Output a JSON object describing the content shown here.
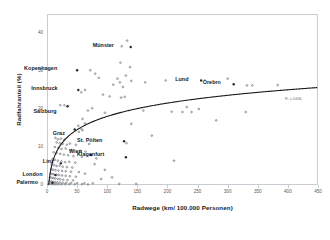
{
  "chart_data": {
    "type": "scatter",
    "title": "",
    "xlabel": "Radwege (km/ 100.000 Personen)",
    "ylabel": "Radfahranteil (%)",
    "xlim": [
      0,
      450
    ],
    "ylim": [
      0,
      45
    ],
    "grid": false,
    "legend": null,
    "xticks": [
      "0",
      "50",
      "100",
      "150",
      "200",
      "250",
      "300",
      "350",
      "400",
      "450"
    ],
    "xtick_values": [
      0,
      50,
      100,
      150,
      200,
      250,
      300,
      350,
      400,
      450
    ],
    "yticks": [
      "0",
      "10",
      "20",
      "30",
      "40"
    ],
    "ytick_values": [
      0,
      10,
      20,
      30,
      40
    ],
    "marker_color": "#6b7075",
    "trendline_color": "#1a1a1a",
    "trendline_type": "logarithmic",
    "annotation": "R² = 0,636",
    "points": [
      {
        "x": 133,
        "y": 38.0
      },
      {
        "x": 124,
        "y": 36.5
      },
      {
        "x": 122,
        "y": 32.2
      },
      {
        "x": 138,
        "y": 31.0
      },
      {
        "x": 72,
        "y": 30.2
      },
      {
        "x": 80,
        "y": 29.3
      },
      {
        "x": 86,
        "y": 28.2
      },
      {
        "x": 117,
        "y": 28.0
      },
      {
        "x": 131,
        "y": 28.8
      },
      {
        "x": 121,
        "y": 27.0
      },
      {
        "x": 140,
        "y": 27.4
      },
      {
        "x": 163,
        "y": 27.0
      },
      {
        "x": 197,
        "y": 27.5
      },
      {
        "x": 110,
        "y": 26.4
      },
      {
        "x": 126,
        "y": 25.8
      },
      {
        "x": 300,
        "y": 28.0
      },
      {
        "x": 332,
        "y": 26.2
      },
      {
        "x": 341,
        "y": 26.2
      },
      {
        "x": 383,
        "y": 26.3
      },
      {
        "x": 63,
        "y": 25.0
      },
      {
        "x": 57,
        "y": 24.4
      },
      {
        "x": 93,
        "y": 23.8
      },
      {
        "x": 104,
        "y": 23.3
      },
      {
        "x": 123,
        "y": 23.0
      },
      {
        "x": 129,
        "y": 23.2
      },
      {
        "x": 22,
        "y": 21.0
      },
      {
        "x": 29,
        "y": 21.0
      },
      {
        "x": 35,
        "y": 20.8
      },
      {
        "x": 75,
        "y": 20.2
      },
      {
        "x": 68,
        "y": 19.6
      },
      {
        "x": 96,
        "y": 19.0
      },
      {
        "x": 160,
        "y": 19.6
      },
      {
        "x": 232,
        "y": 20.5
      },
      {
        "x": 252,
        "y": 20.0
      },
      {
        "x": 207,
        "y": 19.3
      },
      {
        "x": 225,
        "y": 19.2
      },
      {
        "x": 240,
        "y": 19.2
      },
      {
        "x": 330,
        "y": 19.2
      },
      {
        "x": 281,
        "y": 17.0
      },
      {
        "x": 59,
        "y": 17.4
      },
      {
        "x": 63,
        "y": 16.2
      },
      {
        "x": 140,
        "y": 16.1
      },
      {
        "x": 52,
        "y": 15.6
      },
      {
        "x": 57,
        "y": 14.8
      },
      {
        "x": 59,
        "y": 14.4
      },
      {
        "x": 53,
        "y": 14.0
      },
      {
        "x": 174,
        "y": 13.0
      },
      {
        "x": 14,
        "y": 12.4
      },
      {
        "x": 18,
        "y": 12.0
      },
      {
        "x": 23,
        "y": 12.2
      },
      {
        "x": 29,
        "y": 11.9
      },
      {
        "x": 16,
        "y": 11.2
      },
      {
        "x": 21,
        "y": 11.0
      },
      {
        "x": 26,
        "y": 10.8
      },
      {
        "x": 33,
        "y": 10.6
      },
      {
        "x": 38,
        "y": 10.9
      },
      {
        "x": 48,
        "y": 10.6
      },
      {
        "x": 70,
        "y": 10.8
      },
      {
        "x": 132,
        "y": 11.0
      },
      {
        "x": 13,
        "y": 10.0
      },
      {
        "x": 19,
        "y": 9.8
      },
      {
        "x": 24,
        "y": 9.5
      },
      {
        "x": 31,
        "y": 9.6
      },
      {
        "x": 40,
        "y": 9.2
      },
      {
        "x": 55,
        "y": 9.0
      },
      {
        "x": 64,
        "y": 8.8
      },
      {
        "x": 11,
        "y": 8.6
      },
      {
        "x": 16,
        "y": 8.4
      },
      {
        "x": 22,
        "y": 8.2
      },
      {
        "x": 28,
        "y": 8.0
      },
      {
        "x": 35,
        "y": 7.8
      },
      {
        "x": 44,
        "y": 7.6
      },
      {
        "x": 58,
        "y": 7.4
      },
      {
        "x": 82,
        "y": 7.0
      },
      {
        "x": 211,
        "y": 6.4
      },
      {
        "x": 9,
        "y": 6.8
      },
      {
        "x": 13,
        "y": 6.6
      },
      {
        "x": 18,
        "y": 6.4
      },
      {
        "x": 24,
        "y": 6.2
      },
      {
        "x": 30,
        "y": 6.0
      },
      {
        "x": 37,
        "y": 6.1
      },
      {
        "x": 47,
        "y": 5.9
      },
      {
        "x": 8,
        "y": 5.4
      },
      {
        "x": 12,
        "y": 5.2
      },
      {
        "x": 16,
        "y": 5.0
      },
      {
        "x": 21,
        "y": 5.1
      },
      {
        "x": 26,
        "y": 4.8
      },
      {
        "x": 33,
        "y": 4.7
      },
      {
        "x": 42,
        "y": 4.6
      },
      {
        "x": 7,
        "y": 4.2
      },
      {
        "x": 10,
        "y": 4.0
      },
      {
        "x": 14,
        "y": 3.9
      },
      {
        "x": 19,
        "y": 3.8
      },
      {
        "x": 25,
        "y": 3.7
      },
      {
        "x": 31,
        "y": 3.6
      },
      {
        "x": 40,
        "y": 3.5
      },
      {
        "x": 53,
        "y": 3.4
      },
      {
        "x": 6,
        "y": 3.0
      },
      {
        "x": 9,
        "y": 2.9
      },
      {
        "x": 12,
        "y": 2.8
      },
      {
        "x": 16,
        "y": 2.7
      },
      {
        "x": 20,
        "y": 2.6
      },
      {
        "x": 25,
        "y": 2.5
      },
      {
        "x": 31,
        "y": 2.4
      },
      {
        "x": 38,
        "y": 2.3
      },
      {
        "x": 48,
        "y": 2.2
      },
      {
        "x": 5,
        "y": 2.0
      },
      {
        "x": 8,
        "y": 1.9
      },
      {
        "x": 11,
        "y": 1.8
      },
      {
        "x": 14,
        "y": 1.7
      },
      {
        "x": 18,
        "y": 1.6
      },
      {
        "x": 22,
        "y": 1.5
      },
      {
        "x": 27,
        "y": 1.4
      },
      {
        "x": 34,
        "y": 1.3
      },
      {
        "x": 43,
        "y": 1.2
      },
      {
        "x": 4,
        "y": 1.0
      },
      {
        "x": 7,
        "y": 0.9
      },
      {
        "x": 10,
        "y": 0.8
      },
      {
        "x": 13,
        "y": 0.75
      },
      {
        "x": 17,
        "y": 0.7
      },
      {
        "x": 21,
        "y": 0.65
      },
      {
        "x": 26,
        "y": 0.6
      },
      {
        "x": 32,
        "y": 0.55
      },
      {
        "x": 40,
        "y": 0.5
      },
      {
        "x": 50,
        "y": 0.5
      },
      {
        "x": 62,
        "y": 0.45
      },
      {
        "x": 76,
        "y": 0.45
      },
      {
        "x": 3,
        "y": 0.3
      },
      {
        "x": 6,
        "y": 0.28
      },
      {
        "x": 9,
        "y": 0.26
      },
      {
        "x": 12,
        "y": 0.24
      },
      {
        "x": 15,
        "y": 0.22
      },
      {
        "x": 19,
        "y": 0.2
      },
      {
        "x": 24,
        "y": 0.2
      },
      {
        "x": 30,
        "y": 0.2
      },
      {
        "x": 37,
        "y": 0.2
      },
      {
        "x": 46,
        "y": 0.2
      },
      {
        "x": 58,
        "y": 0.2
      },
      {
        "x": 68,
        "y": 0.15
      },
      {
        "x": 90,
        "y": 1.6
      },
      {
        "x": 96,
        "y": 4.0
      },
      {
        "x": 63,
        "y": 3.0
      },
      {
        "x": 79,
        "y": 5.5
      },
      {
        "x": 108,
        "y": 2.0
      },
      {
        "x": 120,
        "y": 0.3
      },
      {
        "x": 148,
        "y": 0.3
      }
    ],
    "labeled_points": [
      {
        "name": "Münster",
        "x": 139,
        "y": 36.3,
        "label_dx": -38,
        "label_dy": -2
      },
      {
        "name": "Kopenhagen",
        "x": 50,
        "y": 30.2,
        "label_dx": -53,
        "label_dy": -2
      },
      {
        "name": "Innsbruck",
        "x": 52,
        "y": 25.0,
        "label_dx": -47,
        "label_dy": -2
      },
      {
        "name": "Lund",
        "x": 256,
        "y": 27.5,
        "label_dx": -26,
        "label_dy": -2
      },
      {
        "name": "Örebro",
        "x": 310,
        "y": 26.5,
        "label_dx": -31,
        "label_dy": -2
      },
      {
        "name": "Salzburg",
        "x": 34,
        "y": 20.7,
        "label_dx": -34,
        "label_dy": 5
      },
      {
        "name": "Graz",
        "x": 46,
        "y": 14.6,
        "label_dx": -22,
        "label_dy": 3
      },
      {
        "name": "St. Pölten",
        "x": 128,
        "y": 11.5,
        "label_dx": -47,
        "label_dy": -1
      },
      {
        "name": "Wien",
        "x": 73,
        "y": 7.9,
        "label_dx": -22,
        "label_dy": -4
      },
      {
        "name": "Klagenfurt",
        "x": 131,
        "y": 7.3,
        "label_dx": -49,
        "label_dy": -3
      },
      {
        "name": "Linz",
        "x": 23,
        "y": 5.7,
        "label_dx": -18,
        "label_dy": -2
      },
      {
        "name": "London",
        "x": 14,
        "y": 2.6,
        "label_dx": -33,
        "label_dy": -1
      },
      {
        "name": "Palermo",
        "x": 9,
        "y": 0.6,
        "label_dx": -36,
        "label_dy": -1
      }
    ]
  }
}
